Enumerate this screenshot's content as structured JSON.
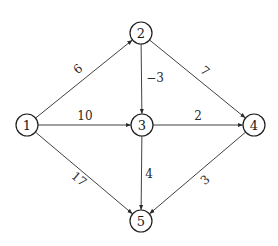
{
  "graph": {
    "type": "directed-weighted",
    "nodes": [
      {
        "id": "1",
        "label": "1",
        "x": 27,
        "y": 125
      },
      {
        "id": "2",
        "label": "2",
        "x": 141,
        "y": 33
      },
      {
        "id": "3",
        "label": "3",
        "x": 142,
        "y": 125
      },
      {
        "id": "4",
        "label": "4",
        "x": 254,
        "y": 125
      },
      {
        "id": "5",
        "label": "5",
        "x": 141,
        "y": 221
      }
    ],
    "edges": [
      {
        "from": "1",
        "to": "2",
        "weight": "6",
        "label_x": 78,
        "label_y": 69,
        "rotate": -39
      },
      {
        "from": "1",
        "to": "3",
        "weight": "10",
        "label_x": 85,
        "label_y": 116,
        "rotate": 0
      },
      {
        "from": "1",
        "to": "5",
        "weight": "17",
        "label_x": 79,
        "label_y": 179,
        "rotate": 40
      },
      {
        "from": "2",
        "to": "3",
        "weight": "−3",
        "label_x": 155,
        "label_y": 78,
        "rotate": 0
      },
      {
        "from": "2",
        "to": "4",
        "weight": "7",
        "label_x": 205,
        "label_y": 71,
        "rotate": 40
      },
      {
        "from": "3",
        "to": "4",
        "weight": "2",
        "label_x": 198,
        "label_y": 116,
        "rotate": 0
      },
      {
        "from": "3",
        "to": "5",
        "weight": "4",
        "label_x": 149,
        "label_y": 174,
        "rotate": 0
      },
      {
        "from": "4",
        "to": "5",
        "weight": "3",
        "label_x": 205,
        "label_y": 180,
        "rotate": -40
      }
    ],
    "node_radius": 11,
    "colors": {
      "stroke": "#1e1e1e",
      "edge": "#2b2b2b",
      "background": "#ffffff"
    }
  }
}
